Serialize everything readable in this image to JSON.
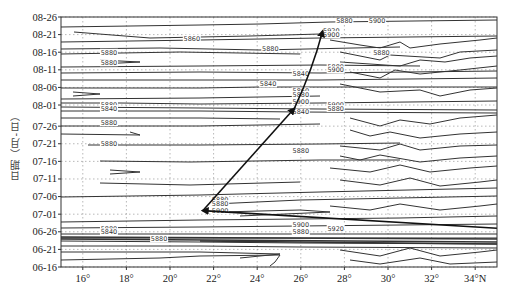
{
  "chart_data": {
    "type": "contour",
    "title": "",
    "xlabel": "",
    "ylabel": "日期（月-日）",
    "x_ticks": [
      "16°",
      "18°",
      "20°",
      "22°",
      "24°",
      "26°",
      "28°",
      "30°",
      "32°",
      "34°N"
    ],
    "x_tick_values": [
      16,
      18,
      20,
      22,
      24,
      26,
      28,
      30,
      32,
      34
    ],
    "xlim": [
      15,
      35
    ],
    "y_ticks": [
      "06-16",
      "06-21",
      "06-26",
      "07-01",
      "07-06",
      "07-11",
      "07-16",
      "07-21",
      "07-26",
      "08-01",
      "08-06",
      "08-11",
      "08-16",
      "08-21",
      "08-26"
    ],
    "grid": "dotted",
    "contour_levels": [
      5840,
      5860,
      5880,
      5900,
      5920
    ],
    "contour_labels": [
      {
        "text": "5880",
        "lat": 17.2,
        "date": "08-16"
      },
      {
        "text": "5880",
        "lat": 17.2,
        "date": "08-13"
      },
      {
        "text": "5860",
        "lat": 21.0,
        "date": "08-20"
      },
      {
        "text": "5880",
        "lat": 24.6,
        "date": "08-17"
      },
      {
        "text": "5880",
        "lat": 29.7,
        "date": "08-16"
      },
      {
        "text": "5880",
        "lat": 28.0,
        "date": "08-25"
      },
      {
        "text": "5900",
        "lat": 29.5,
        "date": "08-25"
      },
      {
        "text": "5920",
        "lat": 27.4,
        "date": "08-22"
      },
      {
        "text": "5900",
        "lat": 27.4,
        "date": "08-21"
      },
      {
        "text": "5840",
        "lat": 24.5,
        "date": "08-07"
      },
      {
        "text": "5840",
        "lat": 26.0,
        "date": "08-10"
      },
      {
        "text": "5880",
        "lat": 27.6,
        "date": "08-12"
      },
      {
        "text": "5900",
        "lat": 27.6,
        "date": "08-11"
      },
      {
        "text": "5860",
        "lat": 26.0,
        "date": "08-05"
      },
      {
        "text": "5880",
        "lat": 26.0,
        "date": "08-04"
      },
      {
        "text": "5900",
        "lat": 26.0,
        "date": "08-02"
      },
      {
        "text": "5880",
        "lat": 17.2,
        "date": "08-01"
      },
      {
        "text": "5840",
        "lat": 17.2,
        "date": "07-31"
      },
      {
        "text": "5900",
        "lat": 27.6,
        "date": "08-01"
      },
      {
        "text": "5880",
        "lat": 27.6,
        "date": "07-31"
      },
      {
        "text": "5840",
        "lat": 26.0,
        "date": "07-30"
      },
      {
        "text": "5880",
        "lat": 17.2,
        "date": "07-27"
      },
      {
        "text": "5880",
        "lat": 17.2,
        "date": "07-21"
      },
      {
        "text": "5880",
        "lat": 26.0,
        "date": "07-19"
      },
      {
        "text": "5880",
        "lat": 22.3,
        "date": "07-05"
      },
      {
        "text": "5880",
        "lat": 22.3,
        "date": "07-04"
      },
      {
        "text": "5900",
        "lat": 22.3,
        "date": "07-02"
      },
      {
        "text": "5880",
        "lat": 17.2,
        "date": "06-27"
      },
      {
        "text": "5840",
        "lat": 17.2,
        "date": "06-26"
      },
      {
        "text": "5900",
        "lat": 26.0,
        "date": "06-28"
      },
      {
        "text": "5880",
        "lat": 26.0,
        "date": "06-26"
      },
      {
        "text": "5880",
        "lat": 19.5,
        "date": "06-24"
      },
      {
        "text": "5920",
        "lat": 27.6,
        "date": "06-27"
      }
    ],
    "ridge_track": {
      "description": "Subtropical high ridge line migration (arrows)",
      "points": [
        {
          "date": "06-27",
          "lat": 35.0
        },
        {
          "date": "07-02",
          "lat": 21.5
        },
        {
          "date": "07-31",
          "lat": 25.7
        },
        {
          "date": "08-22",
          "lat": 27.0
        }
      ]
    }
  },
  "axis": {
    "ylabel": "日期（月-日）",
    "x_ticks": [
      "16°",
      "18°",
      "20°",
      "22°",
      "24°",
      "26°",
      "28°",
      "30°",
      "32°",
      "34°N"
    ],
    "y_ticks": [
      "06-16",
      "06-21",
      "06-26",
      "07-01",
      "07-06",
      "07-11",
      "07-16",
      "07-21",
      "07-26",
      "08-01",
      "08-06",
      "08-11",
      "08-16",
      "08-21",
      "08-26"
    ]
  }
}
